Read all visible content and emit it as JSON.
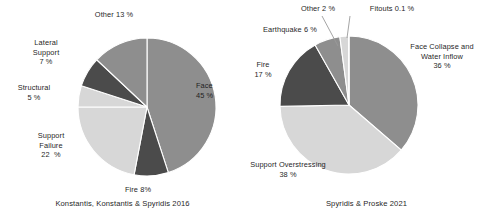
{
  "figure": {
    "background": "#ffffff",
    "text_color": "#1f1f1f"
  },
  "palette": {
    "medium_gray": "#8e8e8e",
    "light_gray": "#d7d7d7",
    "dark_gray": "#4b4b4b",
    "mid_dark_gray": "#6f6f6f",
    "white": "#ffffff",
    "leader_line": "#9a9a9a"
  },
  "charts": [
    {
      "id": "konstantis-2016",
      "caption": "Konstantis, Konstantis & Spyridis 2016",
      "center_x": 147,
      "center_y": 107,
      "radius": 69,
      "start_angle": -90,
      "labels": [
        {
          "name": "other",
          "text": "Other 13 %",
          "x": 72,
          "y": 10,
          "w": 84,
          "align": "lbl-center"
        },
        {
          "name": "lateral-support",
          "text": "Lateral\nSupport\n7 %",
          "x": 17,
          "y": 38,
          "w": 58,
          "align": "lbl-center"
        },
        {
          "name": "structural",
          "text": "Structural\n5 %",
          "x": 4,
          "y": 83,
          "w": 60,
          "align": "lbl-center"
        },
        {
          "name": "support-failure",
          "text": "Support\nFailure\n22  %",
          "x": 23,
          "y": 131,
          "w": 56,
          "align": "lbl-center"
        },
        {
          "name": "fire",
          "text": "Fire 8%",
          "x": 110,
          "y": 185,
          "w": 56,
          "align": "lbl-center"
        },
        {
          "name": "face",
          "text": "Face\n45 %",
          "x": 196,
          "y": 81,
          "w": 44,
          "align": "lbl-left"
        }
      ],
      "chart_data": {
        "type": "pie",
        "title": "Konstantis, Konstantis & Spyridis 2016",
        "labels": [
          "Face",
          "Fire",
          "Support Failure",
          "Structural",
          "Lateral Support",
          "Other"
        ],
        "values": [
          45,
          8,
          22,
          5,
          7,
          13
        ],
        "value_labels": [
          "45 %",
          "8%",
          "22  %",
          "5 %",
          "7 %",
          "13 %"
        ],
        "unit": "%",
        "colors": [
          "#8e8e8e",
          "#4b4b4b",
          "#d7d7d7",
          "#d7d7d7",
          "#4b4b4b",
          "#8e8e8e"
        ],
        "legend": "none",
        "start_angle_deg": -90,
        "direction": "clockwise"
      }
    },
    {
      "id": "spyridis-proske-2021",
      "caption": "Spyridis & Proske 2021",
      "center_x": 105,
      "center_y": 105,
      "radius": 69,
      "start_angle": -90,
      "labels": [
        {
          "name": "other",
          "text": "Other 2 %",
          "x": 41,
          "y": 4,
          "w": 66,
          "align": "lbl-center"
        },
        {
          "name": "fitouts",
          "text": "Fitouts 0.1 %",
          "x": 113,
          "y": 4,
          "w": 70,
          "align": "lbl-center"
        },
        {
          "name": "earthquake",
          "text": "Earthquake 6 %",
          "x": 6,
          "y": 25,
          "w": 80,
          "align": "lbl-center"
        },
        {
          "name": "fire",
          "text": "Fire\n17 %",
          "x": 2,
          "y": 60,
          "w": 34,
          "align": "lbl-center"
        },
        {
          "name": "support-overstressing",
          "text": "Support Overstressing\n38 %",
          "x": -16,
          "y": 160,
          "w": 120,
          "align": "lbl-center"
        },
        {
          "name": "face-collapse",
          "text": "Face Collapse and\nWater Inflow\n36 %",
          "x": 152,
          "y": 42,
          "w": 92,
          "align": "lbl-center"
        }
      ],
      "leader_lines": [
        {
          "name": "other-leader",
          "x1": 78,
          "y1": 16,
          "x2": 94,
          "y2": 46
        },
        {
          "name": "fitouts-leader",
          "x1": 106,
          "y1": 16,
          "x2": 103,
          "y2": 38
        }
      ],
      "chart_data": {
        "type": "pie",
        "title": "Spyridis & Proske 2021",
        "labels": [
          "Face Collapse and Water Inflow",
          "Support Overstressing",
          "Fire",
          "Earthquake",
          "Other",
          "Fitouts"
        ],
        "values": [
          36,
          38,
          17,
          6,
          2,
          0.1
        ],
        "value_labels": [
          "36 %",
          "38 %",
          "17 %",
          "6 %",
          "2 %",
          "0.1 %"
        ],
        "unit": "%",
        "colors": [
          "#8e8e8e",
          "#d7d7d7",
          "#4b4b4b",
          "#8e8e8e",
          "#d7d7d7",
          "#ffffff"
        ],
        "legend": "none",
        "start_angle_deg": -90,
        "direction": "clockwise"
      }
    }
  ]
}
